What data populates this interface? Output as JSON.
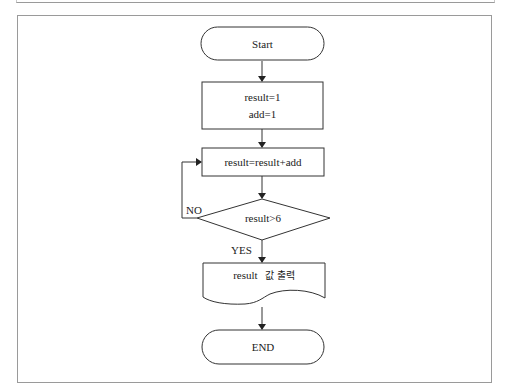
{
  "diagram": {
    "type": "flowchart",
    "nodes": {
      "start": {
        "shape": "terminal",
        "label": "Start"
      },
      "init": {
        "shape": "process",
        "lines": [
          "result=1",
          "add=1"
        ]
      },
      "update": {
        "shape": "process",
        "label": "result=result+add"
      },
      "decision": {
        "shape": "decision",
        "label": "result>6"
      },
      "output": {
        "shape": "document",
        "label_latin": "result",
        "label_korean": "값 출력"
      },
      "end": {
        "shape": "terminal",
        "label": "END"
      }
    },
    "edges": {
      "no_label": "NO",
      "yes_label": "YES"
    },
    "colors": {
      "stroke": "#333333",
      "frame": "#9a9a9a",
      "background": "#ffffff"
    }
  }
}
